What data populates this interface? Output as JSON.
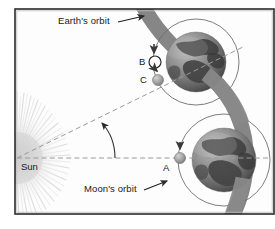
{
  "figure": {
    "type": "astronomy-diagram",
    "background_color": "#fdfdfd",
    "frame_color": "#2b2b2b"
  },
  "labels": {
    "earth_orbit": "Earth's orbit",
    "moons_orbit": "Moon's orbit",
    "sun": "Sun",
    "point_a": "A",
    "point_b": "B",
    "point_c": "C"
  },
  "colors": {
    "orbit_band": "#8c8c8c",
    "orbit_circle": "#6e6e6e",
    "dashed_line": "#9a9a9a",
    "sun_glow": "#d8d8d8",
    "moon_fill": "#a8a8a8",
    "moon_open_fill": "#ffffff",
    "arrow": "#2b2b2b",
    "earth_dark": "#4a4a4a",
    "earth_light": "#b4b4b4"
  },
  "geometry": {
    "sun_center": {
      "x": 17,
      "y": 158
    },
    "earth_top": {
      "x": 196,
      "y": 62,
      "r": 30
    },
    "earth_bottom": {
      "x": 224,
      "y": 160,
      "r": 32
    },
    "moon_orbit_top_r": 43,
    "moon_orbit_bottom_r": 46,
    "point_a": {
      "x": 180,
      "y": 158
    },
    "point_b": {
      "x": 155,
      "y": 62
    },
    "point_c": {
      "x": 157,
      "y": 80
    },
    "angle_arc_degrees": 27
  },
  "annotations": {
    "earth_orbit_arrow": "leader-arrow pointing to dark orbital band",
    "moons_orbit_arrow": "leader-arrow pointing to thin moon orbit circle",
    "angle_arc": "arc with arrowhead between Sun-to-A line and Sun-to-C line",
    "moon_motion_arrows": "small downward arrows showing moon travel direction"
  }
}
